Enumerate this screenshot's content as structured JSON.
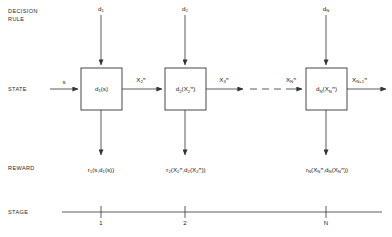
{
  "diagram": {
    "row_labels": [
      {
        "id": "decision-rule",
        "line1": "DECISION",
        "line2": "RULE"
      },
      {
        "id": "state",
        "line1": "STATE",
        "line2": ""
      },
      {
        "id": "reward",
        "line1": "REWARD",
        "line2": ""
      },
      {
        "id": "stage",
        "line1": "STAGE",
        "line2": ""
      }
    ],
    "decision_rules": [
      {
        "id": "d1",
        "base": "d",
        "sub": "1"
      },
      {
        "id": "d2",
        "base": "d",
        "sub": "2"
      },
      {
        "id": "dN",
        "base": "d",
        "sub": "N"
      }
    ],
    "boxes": [
      {
        "id": "box-1",
        "base": "d",
        "sub": "1",
        "arg_open": "(s)",
        "arg_base": "",
        "arg_sub": "",
        "arg_sup": "",
        "arg_close": ""
      },
      {
        "id": "box-2",
        "base": "d",
        "sub": "2",
        "arg_open": "(",
        "arg_base": "X",
        "arg_sub": "2",
        "arg_sup": "π",
        "arg_close": ")"
      },
      {
        "id": "box-N",
        "base": "d",
        "sub": "N",
        "arg_open": "(",
        "arg_base": "X",
        "arg_sub": "N",
        "arg_sup": "π",
        "arg_close": ")"
      }
    ],
    "state_inputs": [
      {
        "id": "state-input-s",
        "text": "s"
      }
    ],
    "state_flows": [
      {
        "id": "flow-x2",
        "base": "X",
        "sub": "2",
        "sup": "π"
      },
      {
        "id": "flow-x3",
        "base": "X",
        "sub": "3",
        "sup": "π"
      },
      {
        "id": "flow-xN",
        "base": "X",
        "sub": "N",
        "sup": "π"
      },
      {
        "id": "flow-xN1",
        "base": "X",
        "sub": "N+1",
        "sup": "π"
      }
    ],
    "rewards": [
      {
        "id": "reward-1",
        "base": "r",
        "sub": "1",
        "text": "(s,d",
        "inner_sub": "1",
        "tail": "(s))"
      },
      {
        "id": "reward-2",
        "base": "r",
        "sub": "2",
        "arg1_base": "X",
        "arg1_sub": "2",
        "arg1_sup": "π",
        "sep": ",d",
        "sep_sub": "2",
        "arg2_base": "X",
        "arg2_sub": "2",
        "arg2_sup": "π"
      },
      {
        "id": "reward-N",
        "base": "r",
        "sub": "N",
        "arg1_base": "X",
        "arg1_sub": "N",
        "arg1_sup": "π",
        "sep": ",d",
        "sep_sub": "N",
        "arg2_base": "X",
        "arg2_sub": "N",
        "arg2_sup": "π"
      }
    ],
    "stage_ticks": [
      {
        "id": "stage-tick-1",
        "label": "1"
      },
      {
        "id": "stage-tick-2",
        "label": "2"
      },
      {
        "id": "stage-tick-N",
        "label": "N"
      }
    ],
    "ellipsis": {
      "id": "dashed-continuation",
      "style": "dashed"
    },
    "colors": {
      "line": "#333333",
      "text": "#1a1a1a",
      "background": "#ffffff"
    }
  }
}
